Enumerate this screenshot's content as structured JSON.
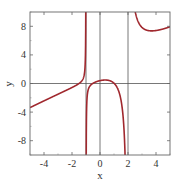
{
  "chart_data": {
    "type": "line",
    "title": "",
    "xlabel": "x",
    "ylabel": "y",
    "xlim": [
      -5,
      5
    ],
    "ylim": [
      -10,
      10
    ],
    "xticks": [
      -4,
      -2,
      0,
      2,
      4
    ],
    "yticks": [
      8,
      4,
      0,
      -4,
      -8
    ],
    "xtick_labels": [
      "-4",
      "-2",
      "0",
      "2",
      "4"
    ],
    "ytick_labels": [
      "8",
      "4",
      "0",
      "-4",
      "-8"
    ],
    "grid": false,
    "reference_lines": {
      "horizontal": [
        0
      ],
      "vertical": [
        -1,
        0,
        2
      ]
    },
    "vertical_asymptotes": [
      -1,
      2
    ],
    "series": [
      {
        "name": "f(x)",
        "color": "#a0282e",
        "branches": [
          {
            "x": [
              -5,
              -4,
              -3,
              -2,
              -1.5,
              -1.2,
              -1.1
            ],
            "y": [
              -3.4,
              -2.5,
              -1.5,
              -0.4,
              0.0,
              1.4,
              2.7
            ]
          },
          {
            "x": [
              -0.95,
              -0.8,
              -0.5,
              0,
              0.3,
              0.8,
              1.3,
              1.7,
              1.85
            ],
            "y": [
              -9.0,
              -4.0,
              -1.4,
              0.4,
              0.4,
              -0.3,
              -2.0,
              -6.0,
              -10.0
            ]
          },
          {
            "x": [
              2.3,
              2.6,
              3,
              3.6,
              4,
              5
            ],
            "y": [
              10.0,
              9.0,
              8.2,
              7.6,
              7.6,
              7.9
            ]
          }
        ]
      }
    ]
  },
  "labels": {
    "xlabel": "x",
    "ylabel": "y",
    "xticks": [
      "-4",
      "-2",
      "0",
      "2",
      "4"
    ],
    "yticks": [
      "8",
      "4",
      "0",
      "-4",
      "-8"
    ]
  }
}
